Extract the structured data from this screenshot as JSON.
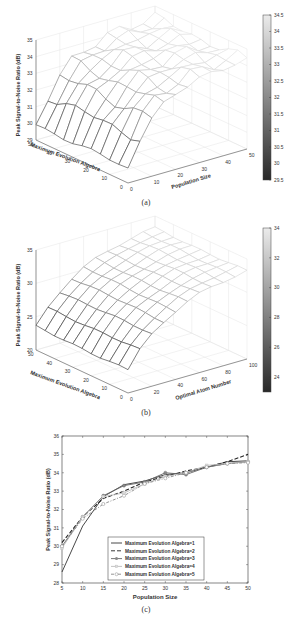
{
  "chart_data": [
    {
      "id": "a",
      "type": "surface3d",
      "caption": "(a)",
      "zlabel": "Peak Signal-to-Noise Ratio (dB)",
      "xlabel": "Population Size",
      "ylabel": "Maximum Evolution Algebra",
      "x_ticks": [
        "0",
        "10",
        "20",
        "30",
        "40",
        "50"
      ],
      "y_ticks": [
        "0",
        "10",
        "20",
        "30",
        "40",
        "50"
      ],
      "z_ticks": [
        "29",
        "30",
        "31",
        "32",
        "33",
        "34",
        "35"
      ],
      "zlim": [
        29,
        35
      ],
      "colorbar": {
        "ticks": [
          "34.5",
          "34",
          "33.5",
          "33",
          "32.5",
          "32",
          "31.5",
          "31",
          "30.5",
          "30",
          "29.5"
        ],
        "range": [
          29.5,
          34.5
        ]
      },
      "grid": true,
      "colormap": "gray"
    },
    {
      "id": "b",
      "type": "surface3d",
      "caption": "(b)",
      "zlabel": "Peak Signal-to-Noise Ratio (dB)",
      "xlabel": "Optimal Atom Number",
      "ylabel": "Maximum Evolution Algebra",
      "x_ticks": [
        "0",
        "20",
        "40",
        "60",
        "80",
        "100"
      ],
      "y_ticks": [
        "0",
        "10",
        "20",
        "30",
        "40",
        "50"
      ],
      "z_ticks": [
        "20",
        "25",
        "30",
        "35"
      ],
      "zlim": [
        20,
        35
      ],
      "colorbar": {
        "ticks": [
          "34",
          "32",
          "30",
          "28",
          "26",
          "24"
        ],
        "range": [
          23,
          34
        ]
      },
      "grid": true,
      "colormap": "gray"
    },
    {
      "id": "c",
      "type": "line",
      "caption": "(c)",
      "title": "",
      "xlabel": "Population Size",
      "ylabel": "Peak Signal-to-Noise Ratio (dB)",
      "x": [
        5,
        10,
        15,
        20,
        25,
        30,
        35,
        40,
        45,
        50
      ],
      "x_ticks": [
        "5",
        "10",
        "15",
        "20",
        "25",
        "30",
        "35",
        "40",
        "45",
        "50"
      ],
      "y_ticks": [
        "28",
        "29",
        "30",
        "31",
        "32",
        "33",
        "34",
        "35",
        "36"
      ],
      "xlim": [
        5,
        50
      ],
      "ylim": [
        28,
        36
      ],
      "legend_position": "lower center",
      "series": [
        {
          "name": "Maximum Evolution Algebra=1",
          "style": "solid",
          "color": "#333333",
          "marker": "none",
          "values": [
            28.6,
            31.1,
            32.7,
            33.35,
            33.55,
            33.9,
            34.0,
            34.3,
            34.6,
            34.65
          ]
        },
        {
          "name": "Maximum Evolution Algebra=2",
          "style": "dashed",
          "color": "#222222",
          "marker": "none",
          "values": [
            30.2,
            31.6,
            32.6,
            33.0,
            33.5,
            33.8,
            34.1,
            34.3,
            34.6,
            35.0
          ]
        },
        {
          "name": "Maximum Evolution Algebra=3",
          "style": "solid",
          "color": "#666666",
          "marker": "circle-filled",
          "values": [
            30.0,
            31.6,
            32.75,
            33.3,
            33.5,
            34.0,
            33.9,
            34.3,
            34.5,
            34.6
          ]
        },
        {
          "name": "Maximum Evolution Algebra=4",
          "style": "solid",
          "color": "#bbbbbb",
          "marker": "square",
          "values": [
            29.9,
            31.6,
            32.7,
            32.9,
            33.4,
            33.8,
            34.0,
            34.4,
            34.5,
            34.6
          ]
        },
        {
          "name": "Maximum Evolution Algebra=5",
          "style": "dashdot",
          "color": "#888888",
          "marker": "circle-open",
          "values": [
            30.0,
            31.5,
            32.3,
            32.75,
            33.4,
            33.7,
            34.0,
            34.3,
            34.5,
            34.55
          ]
        }
      ]
    }
  ]
}
